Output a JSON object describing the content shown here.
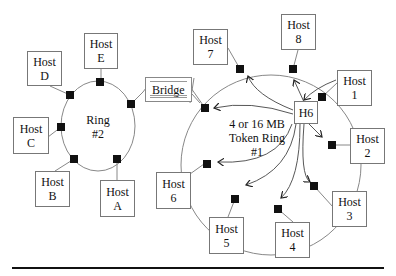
{
  "diagram": {
    "ring2": {
      "label_line1": "Ring",
      "label_line2": "#2"
    },
    "ring1": {
      "label_line1": "4 or 16 MB",
      "label_line2": "Token Ring",
      "label_line3": "#1"
    },
    "bridge": {
      "label": "Bridge"
    },
    "h6": {
      "label": "H6"
    },
    "ring2_hosts": [
      {
        "id": "E",
        "line1": "Host",
        "line2": "E"
      },
      {
        "id": "D",
        "line1": "Host",
        "line2": "D"
      },
      {
        "id": "C",
        "line1": "Host",
        "line2": "C"
      },
      {
        "id": "B",
        "line1": "Host",
        "line2": "B"
      },
      {
        "id": "A",
        "line1": "Host",
        "line2": "A"
      }
    ],
    "ring1_hosts": [
      {
        "id": "7",
        "line1": "Host",
        "line2": "7"
      },
      {
        "id": "8",
        "line1": "Host",
        "line2": "8"
      },
      {
        "id": "1",
        "line1": "Host",
        "line2": "1"
      },
      {
        "id": "2",
        "line1": "Host",
        "line2": "2"
      },
      {
        "id": "3",
        "line1": "Host",
        "line2": "3"
      },
      {
        "id": "4",
        "line1": "Host",
        "line2": "4"
      },
      {
        "id": "5",
        "line1": "Host",
        "line2": "5"
      },
      {
        "id": "6",
        "line1": "Host",
        "line2": "6"
      }
    ]
  }
}
